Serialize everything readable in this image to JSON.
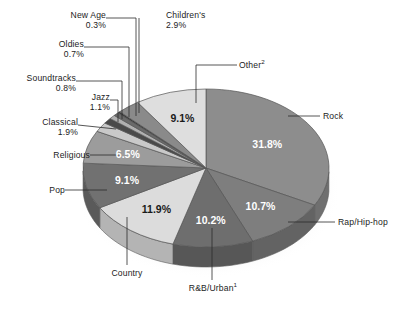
{
  "chart_data": {
    "type": "pie",
    "title": "",
    "subtitle": "",
    "xlabel": "",
    "ylabel": "",
    "legend_position": "none",
    "grid": false,
    "value_suffix": "%",
    "categories": [
      "Rock",
      "Rap/Hip-hop",
      "R&B/Urban",
      "Country",
      "Pop",
      "Religious",
      "Classical",
      "Jazz",
      "Soundtracks",
      "Oldies",
      "New Age",
      "Children's",
      "Other"
    ],
    "values": [
      31.8,
      10.7,
      10.2,
      11.9,
      9.1,
      6.5,
      1.9,
      1.1,
      0.8,
      0.7,
      0.3,
      2.9,
      9.1
    ],
    "slices": [
      {
        "label": "Rock",
        "value": 31.8,
        "value_text": "31.8%",
        "color": "#8d8d8d",
        "side_color": "#6f6f6f",
        "inside_label": true,
        "label_color": "#ffffff"
      },
      {
        "label": "Rap/Hip-hop",
        "value": 10.7,
        "value_text": "10.7%",
        "color": "#7e7e7e",
        "side_color": "#636363",
        "inside_label": true,
        "label_color": "#ffffff"
      },
      {
        "label": "R&B/Urban",
        "value": 10.2,
        "value_text": "10.2%",
        "color": "#6e6e6e",
        "side_color": "#575757",
        "inside_label": true,
        "label_color": "#ffffff"
      },
      {
        "label": "Country",
        "value": 11.9,
        "value_text": "11.9%",
        "color": "#dcdcdc",
        "side_color": "#b4b4b4",
        "inside_label": true,
        "label_color": "#1a1a1a"
      },
      {
        "label": "Pop",
        "value": 9.1,
        "value_text": "9.1%",
        "color": "#717171",
        "side_color": "#5a5a5a",
        "inside_label": true,
        "label_color": "#ffffff"
      },
      {
        "label": "Religious",
        "value": 6.5,
        "value_text": "6.5%",
        "color": "#9c9c9c",
        "side_color": "#7b7b7b",
        "inside_label": true,
        "label_color": "#ffffff"
      },
      {
        "label": "Classical",
        "value": 1.9,
        "value_text": "1.9%",
        "color": "#c9c9c9",
        "side_color": "#a0a0a0",
        "inside_label": false,
        "label_color": "#1a1a1a"
      },
      {
        "label": "Jazz",
        "value": 1.1,
        "value_text": "1.1%",
        "color": "#4a4a4a",
        "side_color": "#3b3b3b",
        "inside_label": false,
        "label_color": "#1a1a1a"
      },
      {
        "label": "Soundtracks",
        "value": 0.8,
        "value_text": "0.8%",
        "color": "#b0b0b0",
        "side_color": "#8c8c8c",
        "inside_label": false,
        "label_color": "#1a1a1a"
      },
      {
        "label": "Oldies",
        "value": 0.7,
        "value_text": "0.7%",
        "color": "#6a6a6a",
        "side_color": "#545454",
        "inside_label": false,
        "label_color": "#1a1a1a"
      },
      {
        "label": "New Age",
        "value": 0.3,
        "value_text": "0.3%",
        "color": "#3a3a3a",
        "side_color": "#2e2e2e",
        "inside_label": false,
        "label_color": "#1a1a1a"
      },
      {
        "label": "Children's",
        "value": 2.9,
        "value_text": "2.9%",
        "color": "#8a8a8a",
        "side_color": "#6d6d6d",
        "inside_label": false,
        "label_color": "#1a1a1a"
      },
      {
        "label": "Other",
        "value": 9.1,
        "value_text": "9.1%",
        "color": "#dedede",
        "side_color": "#b6b6b6",
        "inside_label": true,
        "label_color": "#1a1a1a"
      }
    ]
  },
  "callouts": {
    "new_age": {
      "name": "New Age",
      "pct": "0.3%"
    },
    "oldies": {
      "name": "Oldies",
      "pct": "0.7%"
    },
    "soundtracks": {
      "name": "Soundtracks",
      "pct": "0.8%"
    },
    "jazz": {
      "name": "Jazz",
      "pct": "1.1%"
    },
    "classical": {
      "name": "Classical",
      "pct": "1.9%"
    },
    "religious": {
      "name": "Religious",
      "pct": ""
    },
    "pop": {
      "name": "Pop",
      "pct": ""
    },
    "country": {
      "name": "Country",
      "pct": ""
    },
    "childrens": {
      "name": "Children's",
      "pct": "2.9%"
    },
    "other": {
      "name": "Other",
      "sup": "2"
    },
    "rock": {
      "name": "Rock",
      "pct": ""
    },
    "rap": {
      "name": "Rap/Hip-hop",
      "pct": ""
    },
    "rnb": {
      "name": "R&B/Urban",
      "sup": "1"
    }
  },
  "slice_values": {
    "other": "9.1%",
    "rock": "31.8%",
    "rap": "10.7%",
    "rnb": "10.2%",
    "country": "11.9%",
    "pop": "9.1%",
    "relig": "6.5%"
  },
  "colors": {
    "text": "#1a1a1a",
    "leader": "#2b2b2b",
    "shadow": "#d9d9d9",
    "background": "#ffffff"
  }
}
